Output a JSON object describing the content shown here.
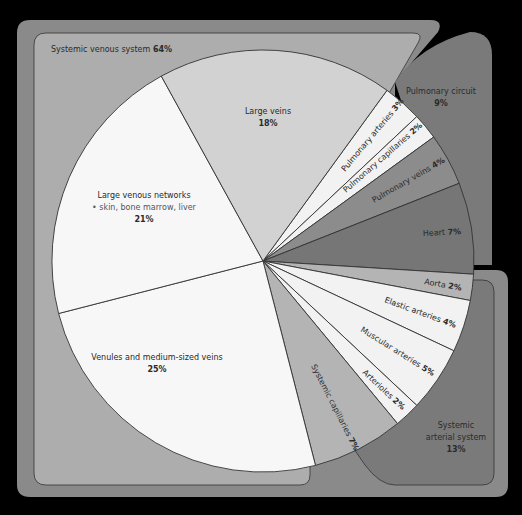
{
  "chart_data": {
    "type": "pie",
    "start_angle_deg": -54,
    "center": [
      263,
      261
    ],
    "radius": 211,
    "slices": [
      {
        "label": "Pulmonary arteries",
        "value": 3,
        "group": "pulmonary",
        "fill": "#f2f2f2"
      },
      {
        "label": "Pulmonary capillaries",
        "value": 2,
        "group": "pulmonary",
        "fill": "#f2f2f2"
      },
      {
        "label": "Pulmonary veins",
        "value": 4,
        "group": "pulmonary",
        "fill": "#8c8c8c"
      },
      {
        "label": "Heart",
        "value": 7,
        "group": "heart",
        "fill": "#767676"
      },
      {
        "label": "Aorta",
        "value": 2,
        "group": "arterial",
        "fill": "#b4b4b4"
      },
      {
        "label": "Elastic arteries",
        "value": 4,
        "group": "arterial",
        "fill": "#f2f2f2"
      },
      {
        "label": "Muscular arteries",
        "value": 5,
        "group": "arterial",
        "fill": "#f2f2f2"
      },
      {
        "label": "Arterioles",
        "value": 2,
        "group": "arterial",
        "fill": "#f2f2f2"
      },
      {
        "label": "Systemic capillaries",
        "value": 7,
        "group": "capillaries",
        "fill": "#b4b4b4"
      },
      {
        "label": "Venules and medium-sized veins",
        "value": 25,
        "group": "venous",
        "fill": "#f7f7f7"
      },
      {
        "label": "Large venous networks",
        "sublabel": "• skin, bone marrow, liver",
        "value": 21,
        "group": "venous",
        "fill": "#f7f7f7"
      },
      {
        "label": "Large veins",
        "value": 18,
        "group": "venous",
        "fill": "#d2d2d2"
      }
    ],
    "groups": [
      {
        "label": "Systemic venous system",
        "value": 64
      },
      {
        "label": "Pulmonary circuit",
        "value": 9
      },
      {
        "label": "Systemic arterial system",
        "value": 13
      }
    ]
  },
  "labels": {
    "venous_group": "Systemic venous system",
    "venous_group_pct": "64%",
    "pulmonary_group": "Pulmonary circuit",
    "pulmonary_group_pct": "9%",
    "arterial_group_line1": "Systemic",
    "arterial_group_line2": "arterial system",
    "arterial_group_pct": "13%",
    "large_veins": "Large veins",
    "large_veins_pct": "18%",
    "large_venous_networks": "Large venous networks",
    "large_venous_networks_sub": "• skin, bone marrow, liver",
    "large_venous_networks_pct": "21%",
    "venules": "Venules and medium-sized veins",
    "venules_pct": "25%",
    "pulmonary_arteries": "Pulmonary arteries",
    "pulmonary_arteries_pct": "3%",
    "pulmonary_capillaries": "Pulmonary capillaries",
    "pulmonary_capillaries_pct": "2%",
    "pulmonary_veins": "Pulmonary veins",
    "pulmonary_veins_pct": "4%",
    "heart": "Heart",
    "heart_pct": "7%",
    "aorta": "Aorta",
    "aorta_pct": "2%",
    "elastic_arteries": "Elastic arteries",
    "elastic_arteries_pct": "4%",
    "muscular_arteries": "Muscular arteries",
    "muscular_arteries_pct": "5%",
    "arterioles": "Arterioles",
    "arterioles_pct": "2%",
    "systemic_capillaries": "Systemic capillaries",
    "systemic_capillaries_pct": "7%"
  },
  "colors": {
    "background": "#000000",
    "outer_frame": "#8a8a8a",
    "venous_panel": "#adadad",
    "pulmonary_panel": "#7a7a7a",
    "arterial_panel": "#7a7a7a",
    "outline": "#333333"
  }
}
